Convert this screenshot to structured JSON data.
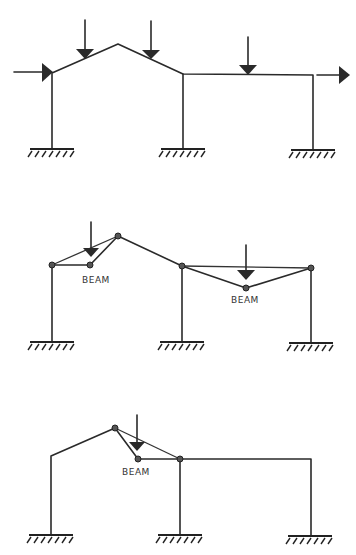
{
  "diagrams": [
    {
      "id": "frame-loaded",
      "description": "Portal frame with gable roof and flat bay under loads",
      "loads": [
        "vertical-load-1",
        "vertical-load-2",
        "vertical-load-3",
        "horizontal-load-left",
        "horizontal-load-right"
      ]
    },
    {
      "id": "combined-beam-mechanisms",
      "description": "Beam mechanisms in both bays",
      "labels": {
        "beam_left": "BEAM",
        "beam_right": "BEAM"
      }
    },
    {
      "id": "single-beam-mechanism",
      "description": "Beam mechanism in right roof slope",
      "labels": {
        "beam": "BEAM"
      }
    }
  ],
  "colors": {
    "line": "#2a2a2a",
    "node": "#555555",
    "background": "#ffffff"
  }
}
